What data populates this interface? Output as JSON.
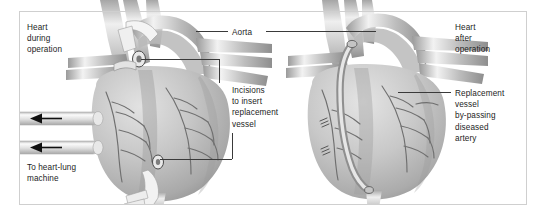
{
  "figure": {
    "type": "medical-illustration",
    "style": "grayscale anatomical drawing",
    "panels": [
      {
        "id": "left",
        "caption": "Heart during operation"
      },
      {
        "id": "right",
        "caption": "Heart after operation"
      }
    ]
  },
  "colors": {
    "background": "#ffffff",
    "frame_border": "#cfcfcf",
    "label_text": "#1d1d1d",
    "leader_line": "#3a3a3a",
    "heart_light": "#d8d8d8",
    "heart_mid": "#b4b4b4",
    "heart_dark": "#8a8a8a",
    "vessel_highlight": "#efefef",
    "arrow": "#111111"
  },
  "labels": {
    "heart_during_operation": "Heart\nduring\noperation",
    "to_heart_lung_machine": "To heart-lung\nmachine",
    "aorta": "Aorta",
    "incisions": "Incisions\nto insert\nreplacement\nvessel",
    "heart_after_operation": "Heart\nafter\noperation",
    "replacement_vessel": "Replacement\nvessel\nby-passing\ndiseased\nartery"
  },
  "annotations": {
    "cannula_top": "cannula-tube-arrow-top",
    "cannula_bottom": "cannula-tube-arrow-bottom",
    "arrow_direction": "left"
  }
}
